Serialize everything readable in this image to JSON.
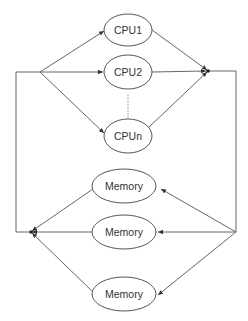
{
  "diagram": {
    "type": "flow",
    "nodes": [
      {
        "id": "cpu1",
        "label": "CPU1",
        "shape": "ellipse",
        "cx": 128,
        "cy": 30,
        "rx": 24,
        "ry": 16
      },
      {
        "id": "cpu2",
        "label": "CPU2",
        "shape": "ellipse",
        "cx": 128,
        "cy": 72,
        "rx": 24,
        "ry": 17
      },
      {
        "id": "cpun",
        "label": "CPUn",
        "shape": "ellipse",
        "cx": 128,
        "cy": 136,
        "rx": 24,
        "ry": 17
      },
      {
        "id": "mem1",
        "label": "Memory",
        "shape": "ellipse",
        "cx": 124,
        "cy": 186,
        "rx": 32,
        "ry": 17
      },
      {
        "id": "mem2",
        "label": "Memory",
        "shape": "ellipse",
        "cx": 124,
        "cy": 232,
        "rx": 32,
        "ry": 17
      },
      {
        "id": "mem3",
        "label": "Memory",
        "shape": "ellipse",
        "cx": 124,
        "cy": 294,
        "rx": 32,
        "ry": 17
      }
    ],
    "junctions": [
      {
        "id": "cpu-fork",
        "x": 40,
        "y": 72
      },
      {
        "id": "cpu-join",
        "x": 208,
        "y": 71
      },
      {
        "id": "mem-fork",
        "x": 236,
        "y": 232
      },
      {
        "id": "mem-join",
        "x": 31,
        "y": 232
      }
    ],
    "edges": [
      {
        "from": "cpu-fork",
        "to": "cpu1",
        "arrow": true
      },
      {
        "from": "cpu-fork",
        "to": "cpu2",
        "arrow": true
      },
      {
        "from": "cpu-fork",
        "to": "cpun",
        "arrow": true
      },
      {
        "from": "cpu1",
        "to": "cpu-join",
        "arrow": true
      },
      {
        "from": "cpu2",
        "to": "cpu-join",
        "arrow": true
      },
      {
        "from": "cpun",
        "to": "cpu-join",
        "arrow": true
      },
      {
        "from": "cpu-join",
        "to": "mem-fork",
        "arrow": false,
        "route": "right-side"
      },
      {
        "from": "mem-fork",
        "to": "mem1",
        "arrow": true
      },
      {
        "from": "mem-fork",
        "to": "mem2",
        "arrow": true
      },
      {
        "from": "mem-fork",
        "to": "mem3",
        "arrow": true
      },
      {
        "from": "mem1",
        "to": "mem-join",
        "arrow": true
      },
      {
        "from": "mem2",
        "to": "mem-join",
        "arrow": true
      },
      {
        "from": "mem3",
        "to": "mem-join",
        "arrow": true
      },
      {
        "from": "mem-join",
        "to": "cpu-fork",
        "arrow": false,
        "route": "left-side"
      }
    ],
    "ellipsis": {
      "description": "vertical dotted line between CPU2 and CPUn",
      "x": 128,
      "y1": 95,
      "y2": 118
    },
    "colors": {
      "stroke": "#555555",
      "edge": "#666666",
      "text": "#333333",
      "background": "#ffffff"
    }
  }
}
